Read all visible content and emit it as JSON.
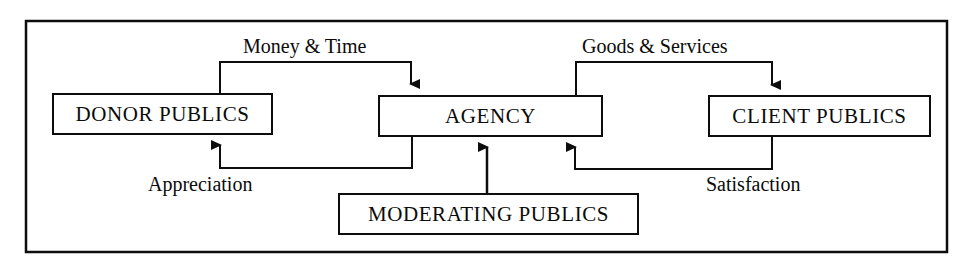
{
  "diagram": {
    "border_color": "#0d0d0d",
    "line_color": "#0d0d0d",
    "background": "#ffffff",
    "nodes": [
      {
        "id": "donor",
        "label": "DONOR PUBLICS"
      },
      {
        "id": "agency",
        "label": "AGENCY"
      },
      {
        "id": "client",
        "label": "CLIENT PUBLICS"
      },
      {
        "id": "moderating",
        "label": "MODERATING PUBLICS"
      }
    ],
    "edges": [
      {
        "id": "money-time",
        "label": "Money & Time",
        "from": "donor",
        "to": "agency"
      },
      {
        "id": "goods-services",
        "label": "Goods & Services",
        "from": "agency",
        "to": "client"
      },
      {
        "id": "appreciation",
        "label": "Appreciation",
        "from": "agency",
        "to": "donor"
      },
      {
        "id": "satisfaction",
        "label": "Satisfaction",
        "from": "client",
        "to": "agency"
      },
      {
        "id": "moderating-influence",
        "label": "",
        "from": "moderating",
        "to": "agency"
      }
    ]
  }
}
